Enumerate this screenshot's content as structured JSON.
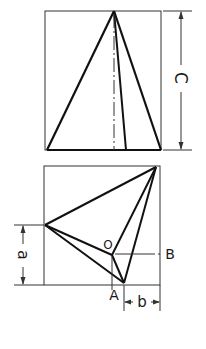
{
  "figure": {
    "type": "orthographic-projection",
    "views": [
      "front elevation",
      "top plan"
    ]
  },
  "labels": {
    "dim_c": "C",
    "dim_a": "a",
    "dim_b": "b",
    "point_o": "O",
    "point_a": "A",
    "point_b": "B"
  },
  "colors": {
    "ink": "#1a1a1a",
    "paper": "#ffffff"
  }
}
